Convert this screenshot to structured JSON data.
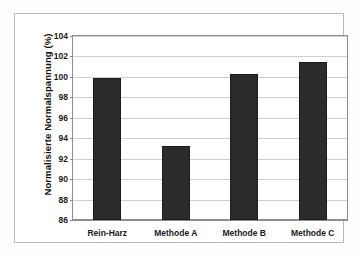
{
  "chart_data": {
    "type": "bar",
    "title": "",
    "subtitle": "",
    "xlabel": "",
    "ylabel": "Normalisierte Normalspannung (%)",
    "categories": [
      "Rein-Harz",
      "Methode A",
      "Methode B",
      "Methode C"
    ],
    "values": [
      99.9,
      93.2,
      100.3,
      101.5
    ],
    "ylim": [
      86,
      104
    ],
    "ytick_labels": [
      "104",
      "102",
      "100",
      "98",
      "96",
      "94",
      "92",
      "90",
      "88",
      "86"
    ],
    "ytick_values": [
      104,
      102,
      100,
      98,
      96,
      94,
      92,
      90,
      88,
      86
    ],
    "ytick_step": 2,
    "grid": true,
    "grid_axis": "y",
    "legend": false,
    "legend_position": "none",
    "bar_color": "#2b2b2b",
    "grid_color": "#cfcfcf",
    "axis_color": "#8e8e8e",
    "plot_background": "#ffffff",
    "figure_background": "#fdfdfd"
  }
}
